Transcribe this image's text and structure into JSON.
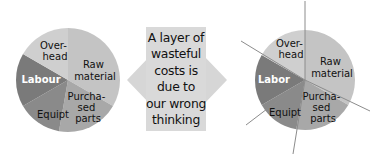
{
  "colors": {
    "slice_lightest": "#cfcfcf",
    "slice_light": "#c4c4c4",
    "slice_mid": "#a8a8a8",
    "slice_dark": "#8a8a8a",
    "slice_darkest": "#7a7a7a",
    "arrow": "#d6d6d6",
    "box": "#d9d9d9",
    "line": "#8c8c8c"
  },
  "left_pie": {
    "slices": [
      {
        "label_lines": [
          "Raw",
          "material"
        ],
        "text_color": "#111111"
      },
      {
        "label_lines": [
          "Purcha-",
          "sed",
          "parts"
        ],
        "text_color": "#111111"
      },
      {
        "label_lines": [
          "Equipt"
        ],
        "text_color": "#111111"
      },
      {
        "label_lines": [
          "Labour"
        ],
        "text_color": "#ffffff"
      },
      {
        "label_lines": [
          "Over-",
          "head"
        ],
        "text_color": "#111111"
      }
    ]
  },
  "center": {
    "lines": [
      "A layer of",
      "wasteful",
      "costs is",
      "due to",
      "our wrong",
      "thinking"
    ]
  },
  "right_pie": {
    "slices": [
      {
        "label_lines": [
          "Raw",
          "material"
        ],
        "text_color": "#111111"
      },
      {
        "label_lines": [
          "Purcha-",
          "sed",
          "parts"
        ],
        "text_color": "#111111"
      },
      {
        "label_lines": [
          "Equipt"
        ],
        "text_color": "#111111"
      },
      {
        "label_lines": [
          "Labor"
        ],
        "text_color": "#ffffff"
      },
      {
        "label_lines": [
          "Over-",
          "head"
        ],
        "text_color": "#111111"
      }
    ]
  }
}
